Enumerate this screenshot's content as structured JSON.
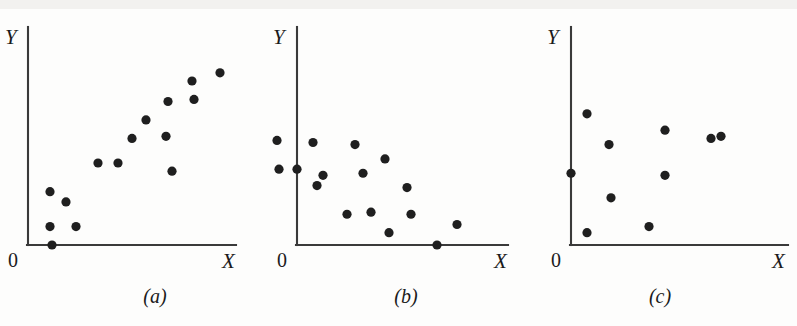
{
  "figure": {
    "background": "#fdfdfc",
    "ink_color": "#1f1f1f",
    "axis_color": "#3a3a3a",
    "width": 797,
    "height": 326
  },
  "chart_data": [
    {
      "type": "scatter",
      "title": "",
      "caption": "(a)",
      "xlabel": "X",
      "ylabel": "Y",
      "origin_label": "0",
      "relationship": "positive linear association",
      "grid": false,
      "legend": "none",
      "xlim": [
        0,
        100
      ],
      "ylim": [
        0,
        100
      ],
      "n_points": 15,
      "points": [
        {
          "x": 12,
          "y": 0
        },
        {
          "x": 11,
          "y": 9
        },
        {
          "x": 24,
          "y": 9
        },
        {
          "x": 11,
          "y": 26
        },
        {
          "x": 19,
          "y": 21
        },
        {
          "x": 35,
          "y": 40
        },
        {
          "x": 45,
          "y": 40
        },
        {
          "x": 52,
          "y": 52
        },
        {
          "x": 69,
          "y": 53
        },
        {
          "x": 59,
          "y": 61
        },
        {
          "x": 70,
          "y": 70
        },
        {
          "x": 72,
          "y": 36
        },
        {
          "x": 83,
          "y": 71
        },
        {
          "x": 82,
          "y": 80
        },
        {
          "x": 96,
          "y": 84
        }
      ]
    },
    {
      "type": "scatter",
      "title": "",
      "caption": "(b)",
      "xlabel": "X",
      "ylabel": "Y",
      "origin_label": "0",
      "relationship": "negative linear association",
      "grid": false,
      "legend": "none",
      "xlim": [
        0,
        100
      ],
      "ylim": [
        0,
        100
      ],
      "n_points": 16,
      "points": [
        {
          "x": -10,
          "y": 51
        },
        {
          "x": -9,
          "y": 37
        },
        {
          "x": 0,
          "y": 37
        },
        {
          "x": 8,
          "y": 50
        },
        {
          "x": 10,
          "y": 29
        },
        {
          "x": 13,
          "y": 34
        },
        {
          "x": 25,
          "y": 15
        },
        {
          "x": 29,
          "y": 49
        },
        {
          "x": 33,
          "y": 35
        },
        {
          "x": 37,
          "y": 16
        },
        {
          "x": 44,
          "y": 42
        },
        {
          "x": 46,
          "y": 6
        },
        {
          "x": 55,
          "y": 28
        },
        {
          "x": 57,
          "y": 15
        },
        {
          "x": 70,
          "y": 0
        },
        {
          "x": 80,
          "y": 10
        }
      ]
    },
    {
      "type": "scatter",
      "title": "",
      "caption": "(c)",
      "xlabel": "X",
      "ylabel": "Y",
      "origin_label": "0",
      "relationship": "no association",
      "grid": false,
      "legend": "none",
      "xlim": [
        0,
        100
      ],
      "ylim": [
        0,
        100
      ],
      "n_points": 9,
      "points": [
        {
          "x": 0,
          "y": 35
        },
        {
          "x": 8,
          "y": 64
        },
        {
          "x": 8,
          "y": 6
        },
        {
          "x": 19,
          "y": 49
        },
        {
          "x": 20,
          "y": 23
        },
        {
          "x": 39,
          "y": 9
        },
        {
          "x": 47,
          "y": 56
        },
        {
          "x": 47,
          "y": 34
        },
        {
          "x": 70,
          "y": 52
        },
        {
          "x": 75,
          "y": 53
        }
      ]
    }
  ],
  "panels": [
    {
      "id": "panel-a",
      "caption": "(a)",
      "xlabel": "X",
      "ylabel": "Y",
      "origin_label": "0"
    },
    {
      "id": "panel-b",
      "caption": "(b)",
      "xlabel": "X",
      "ylabel": "Y",
      "origin_label": "0"
    },
    {
      "id": "panel-c",
      "caption": "(c)",
      "xlabel": "X",
      "ylabel": "Y",
      "origin_label": "0"
    }
  ]
}
